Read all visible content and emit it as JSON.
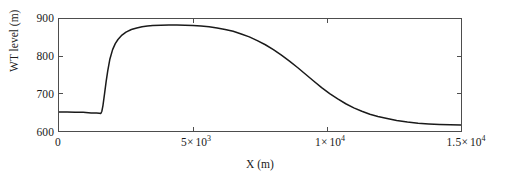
{
  "chart_data": {
    "type": "line",
    "title": "",
    "xlabel": "X (m)",
    "ylabel": "WT level (m)",
    "xlim": [
      0,
      15000
    ],
    "ylim": [
      600,
      900
    ],
    "grid": false,
    "legend": null,
    "line_color": "#1a1a1a",
    "axis_color": "#4d4d4d",
    "background": "#ffffff",
    "xticks": [
      {
        "value": 0,
        "label": "0",
        "mantissa": "0",
        "power": "",
        "exp": ""
      },
      {
        "value": 5000,
        "label": "5× 10³",
        "mantissa": "5×",
        "power": "10",
        "exp": "3"
      },
      {
        "value": 10000,
        "label": "1× 10⁴",
        "mantissa": "1×",
        "power": "10",
        "exp": "4"
      },
      {
        "value": 15000,
        "label": "1.5× 10⁴",
        "mantissa": "1.5×",
        "power": "10",
        "exp": "4"
      }
    ],
    "yticks": [
      {
        "value": 900,
        "label": "900"
      },
      {
        "value": 800,
        "label": "800"
      },
      {
        "value": 700,
        "label": "700"
      },
      {
        "value": 600,
        "label": "600"
      }
    ],
    "series": [
      {
        "name": "WT level profile",
        "x": [
          0,
          300,
          600,
          900,
          1200,
          1400,
          1500,
          1560,
          1600,
          1640,
          1700,
          1760,
          1820,
          1900,
          2000,
          2100,
          2200,
          2350,
          2500,
          2700,
          2900,
          3100,
          3300,
          3500,
          3800,
          4100,
          4400,
          4700,
          5000,
          5300,
          5600,
          5900,
          6200,
          6500,
          6800,
          7100,
          7400,
          7700,
          8000,
          8300,
          8600,
          8900,
          9200,
          9500,
          9800,
          10100,
          10400,
          10700,
          11000,
          11300,
          11600,
          11900,
          12200,
          12600,
          13000,
          13400,
          13800,
          14200,
          14600,
          15000
        ],
        "y": [
          651,
          651,
          650.5,
          650,
          648.5,
          648,
          647.5,
          647,
          653,
          668,
          700,
          733,
          762,
          793,
          818,
          834,
          845,
          857,
          865,
          872,
          876,
          879,
          881,
          882.5,
          883.5,
          884,
          884,
          883.5,
          882.5,
          881,
          879,
          876,
          872,
          867,
          860,
          852,
          842,
          831,
          818,
          803,
          787,
          770,
          752,
          734,
          716,
          700,
          686,
          673,
          662,
          653,
          645,
          639,
          634,
          628,
          624,
          621,
          619,
          617.5,
          616.5,
          616
        ]
      }
    ],
    "annotations": {
      "peak_value": 884,
      "peak_x": 4250,
      "baseline_left": 650,
      "baseline_right": 616
    }
  }
}
